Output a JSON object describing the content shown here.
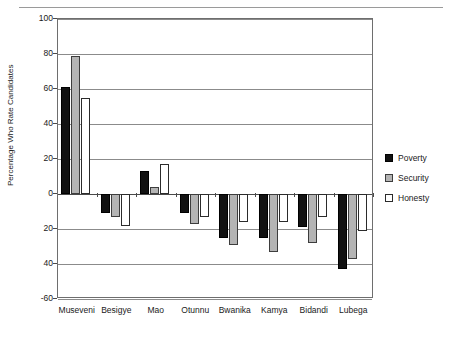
{
  "chart_data": {
    "type": "bar",
    "title": "",
    "xlabel": "",
    "ylabel": "Percentage Who Rate Candidates",
    "categories": [
      "Museveni",
      "Besigye",
      "Mao",
      "Otunnu",
      "Bwanika",
      "Kamya",
      "Bidandi",
      "Lubega"
    ],
    "series": [
      {
        "name": "Poverty",
        "color": "#121212",
        "values": [
          61,
          -11,
          13,
          -11,
          -25,
          -25,
          -19,
          -43
        ]
      },
      {
        "name": "Security",
        "color": "#b4b4b4",
        "values": [
          79,
          -13,
          4,
          -17,
          -29,
          -33,
          -28,
          -37
        ]
      },
      {
        "name": "Honesty",
        "color": "#ffffff",
        "values": [
          55,
          -18,
          17,
          -13,
          -16,
          -16,
          -13,
          -21
        ]
      }
    ],
    "ylim": [
      -60,
      100
    ],
    "yticks": [
      100,
      80,
      60,
      40,
      20,
      0,
      20,
      40,
      -60
    ],
    "ytick_labels": [
      "100",
      "80",
      "60",
      "40",
      "20",
      "0",
      "20",
      "40",
      "-60"
    ],
    "grid": true,
    "legend_position": "right"
  },
  "legend": {
    "items": [
      {
        "label": "Poverty"
      },
      {
        "label": "Security"
      },
      {
        "label": "Honesty"
      }
    ]
  },
  "axes": {
    "y_title": "Percentage Who Rate Candidates"
  }
}
